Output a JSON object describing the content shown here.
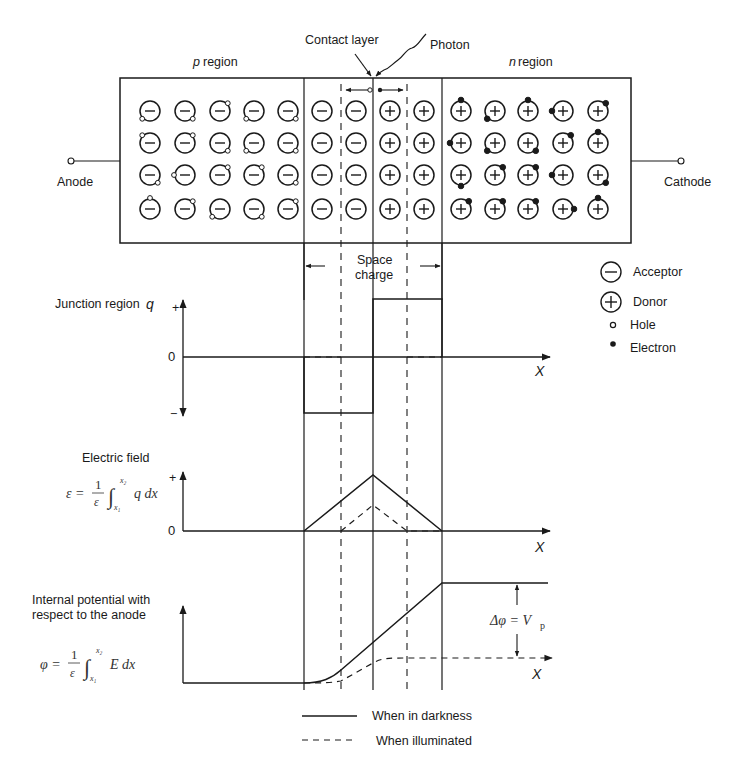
{
  "labels": {
    "contact_layer": "Contact layer",
    "photon": "Photon",
    "p_region_var": "p",
    "p_region": "region",
    "n_region_var": "n",
    "n_region": "region",
    "anode": "Anode",
    "cathode": "Cathode",
    "space_charge_1": "Space",
    "space_charge_2": "charge"
  },
  "legend_particles": [
    {
      "symbol": "−",
      "label": "Acceptor"
    },
    {
      "symbol": "+",
      "label": "Donor"
    },
    {
      "symbol": "o",
      "label": "Hole"
    },
    {
      "symbol": "•",
      "label": "Electron"
    }
  ],
  "plots": {
    "charge": {
      "title": "Junction region",
      "var": "q",
      "plus": "+",
      "zero": "0",
      "minus": "−",
      "axis": "X"
    },
    "field": {
      "title": "Electric field",
      "formula_lhs": "ε =",
      "formula_num": "1",
      "formula_den": "ε",
      "formula_upper": "x₂",
      "formula_lower": "x₁",
      "formula_body": "q dx",
      "plus": "+",
      "zero": "0",
      "axis": "X"
    },
    "potential": {
      "title_1": "Internal potential with",
      "title_2": "respect to the anode",
      "formula_lhs": "φ =",
      "formula_num": "1",
      "formula_den": "ε",
      "formula_upper": "x₂",
      "formula_lower": "x₁",
      "formula_body": "E dx",
      "delta": "Δφ = V",
      "delta_sub": "p",
      "axis": "X"
    }
  },
  "line_legend": [
    {
      "style": "solid",
      "label": "When in darkness"
    },
    {
      "style": "dashed",
      "label": "When illuminated"
    }
  ]
}
